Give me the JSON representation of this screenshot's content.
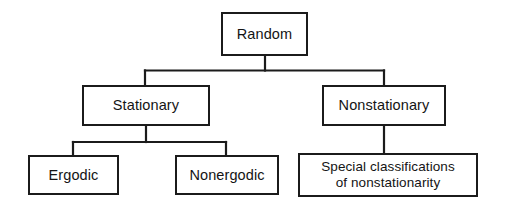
{
  "diagram": {
    "type": "tree",
    "background_color": "#ffffff",
    "line_color": "#1b1b1b",
    "text_color": "#141414",
    "nodes": [
      {
        "id": "random",
        "label": "Random",
        "level": 0
      },
      {
        "id": "stationary",
        "label": "Stationary",
        "level": 1
      },
      {
        "id": "nonstationary",
        "label": "Nonstationary",
        "level": 1
      },
      {
        "id": "ergodic",
        "label": "Ergodic",
        "level": 2
      },
      {
        "id": "nonergodic",
        "label": "Nonergodic",
        "level": 2
      },
      {
        "id": "special",
        "label": "Special classifications\nof nonstationarity",
        "level": 2
      }
    ],
    "edges": [
      {
        "from": "random",
        "to": "stationary"
      },
      {
        "from": "random",
        "to": "nonstationary"
      },
      {
        "from": "stationary",
        "to": "ergodic"
      },
      {
        "from": "stationary",
        "to": "nonergodic"
      },
      {
        "from": "nonstationary",
        "to": "special"
      }
    ]
  }
}
